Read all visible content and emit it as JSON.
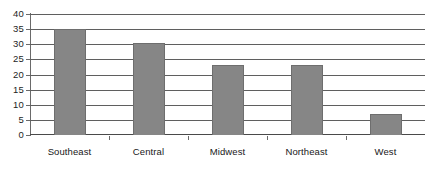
{
  "chart_data": {
    "type": "bar",
    "title": "",
    "subtitle": "",
    "xlabel": "",
    "ylabel": "",
    "categories": [
      "Southeast",
      "Central",
      "Midwest",
      "Northeast",
      "West"
    ],
    "values": [
      35,
      30.5,
      23,
      23,
      7
    ],
    "ylim": [
      0,
      40
    ],
    "ytick_labels": [
      "0",
      "5",
      "10",
      "15",
      "20",
      "25",
      "30",
      "35",
      "40"
    ],
    "ytick_values": [
      0,
      5,
      10,
      15,
      20,
      25,
      30,
      35,
      40
    ],
    "grid": true,
    "grid_axis": "y",
    "legend": false,
    "legend_position": "none",
    "series": [
      {
        "name": "Region values",
        "values": [
          35,
          30.5,
          23,
          23,
          7
        ]
      }
    ],
    "colors": {
      "bar_fill": "#868686",
      "bar_stroke": "#6e6e6e",
      "gridline": "#5f5f5f",
      "axis": "#6a6a6a",
      "text": "#1d1d1d",
      "background": "#ffffff"
    }
  }
}
